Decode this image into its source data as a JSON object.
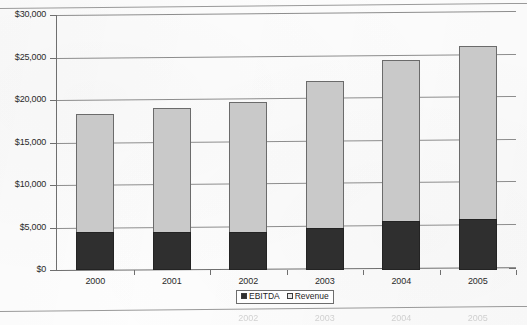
{
  "chart_data": {
    "type": "bar",
    "subtype": "stacked",
    "title": "",
    "xlabel": "",
    "ylabel": "",
    "categories": [
      "2000",
      "2001",
      "2002",
      "2003",
      "2004",
      "2005"
    ],
    "series": [
      {
        "name": "EBITDA",
        "color": "#2f2f2f",
        "values": [
          4500,
          4500,
          4500,
          5000,
          5800,
          6000
        ]
      },
      {
        "name": "Revenue",
        "color": "#c9c9c9",
        "values": [
          18400,
          19100,
          19800,
          22200,
          24700,
          26400
        ]
      }
    ],
    "ylim": [
      0,
      30000
    ],
    "ytick_values": [
      0,
      5000,
      10000,
      15000,
      20000,
      25000,
      30000
    ],
    "ytick_labels": [
      "$0",
      "$5,000",
      "$10,000",
      "$15,000",
      "$20,000",
      "$25,000",
      "$30,000"
    ],
    "grid": true,
    "legend_position": "bottom",
    "note": "Revenue values are the total bar height; the EBITDA segment is drawn from $0 up to its value inside the Revenue bar."
  },
  "legend": {
    "items": [
      {
        "label": "EBITDA",
        "swatch": "black-square-swatch"
      },
      {
        "label": "Revenue",
        "swatch": "light-square-swatch"
      }
    ]
  },
  "scan_artifacts": {
    "ghost_labels": [
      "2002",
      "2003",
      "2004",
      "2005"
    ]
  }
}
